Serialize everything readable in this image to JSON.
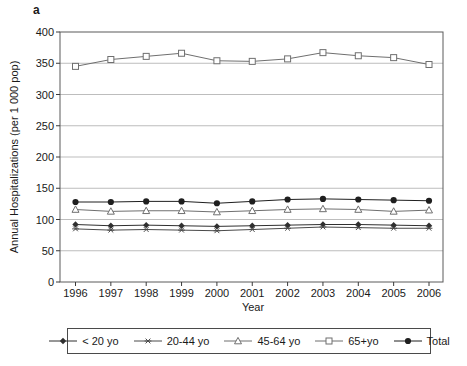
{
  "panel_label": "a",
  "chart_data": {
    "type": "line",
    "x": [
      1996,
      1997,
      1998,
      1999,
      2000,
      2001,
      2002,
      2003,
      2004,
      2005,
      2006
    ],
    "xlabel": "Year",
    "ylabel": "Annual Hospitalizations (per 1 000 pop)",
    "ylim": [
      0,
      400
    ],
    "ytick_step": 50,
    "grid": "horizontal",
    "legend_position": "bottom",
    "series": [
      {
        "name": "< 20 yo",
        "marker": "filled-diamond",
        "color": "#2f2f2f",
        "values": [
          92,
          90,
          91,
          90,
          89,
          90,
          91,
          92,
          92,
          91,
          90
        ]
      },
      {
        "name": "20-44 yo",
        "marker": "asterisk",
        "color": "#4a4a4a",
        "values": [
          85,
          83,
          84,
          83,
          82,
          84,
          86,
          88,
          87,
          86,
          86
        ]
      },
      {
        "name": "45-64 yo",
        "marker": "open-triangle",
        "color": "#6f6f6f",
        "values": [
          116,
          113,
          114,
          114,
          112,
          114,
          116,
          117,
          116,
          113,
          115
        ]
      },
      {
        "name": "65+yo",
        "marker": "open-square",
        "color": "#6f6f6f",
        "values": [
          345,
          356,
          361,
          366,
          354,
          353,
          357,
          367,
          362,
          359,
          348
        ]
      },
      {
        "name": "Total",
        "marker": "filled-circle",
        "color": "#1f1f1f",
        "values": [
          128,
          128,
          129,
          129,
          126,
          129,
          132,
          133,
          132,
          131,
          130
        ]
      }
    ]
  },
  "colors": {
    "background": "#ffffff",
    "plot_border": "#5a5a5a",
    "gridline": "#bdbdbd",
    "tick": "#3a3a3a",
    "text": "#1a1a1a"
  }
}
